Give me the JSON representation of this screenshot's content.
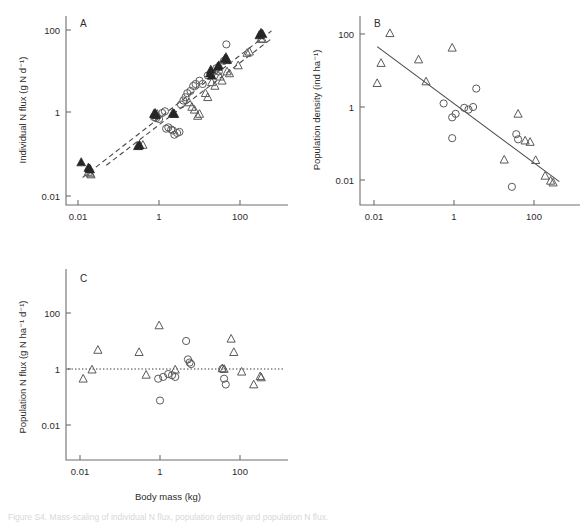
{
  "figure": {
    "caption": "Figure S4. Mass-scaling of individual N flux, population density and population N flux.",
    "panels": [
      "A",
      "B",
      "C"
    ]
  },
  "chart_data": [
    {
      "type": "scatter",
      "panel_label": "A",
      "title": "",
      "xlabel": "",
      "ylabel": "Individual N flux (g N d⁻¹)",
      "xscale": "log",
      "yscale": "log",
      "xlim": [
        0.0015,
        1000
      ],
      "ylim": [
        0.01,
        300
      ],
      "xticks": [
        0.01,
        1,
        100
      ],
      "xticklabels": [
        "0.01",
        "1",
        "100"
      ],
      "yticks": [
        0.01,
        1,
        100
      ],
      "yticklabels": [
        "0.01",
        "1",
        "100"
      ],
      "grid": false,
      "legend": null,
      "series": [
        {
          "name": "filled-triangle",
          "marker": "filled-triangle",
          "points": [
            [
              0.012,
              0.065
            ],
            [
              0.018,
              0.048
            ],
            [
              0.019,
              0.046
            ],
            [
              0.02,
              0.044
            ],
            [
              0.3,
              0.16
            ],
            [
              0.33,
              0.17
            ],
            [
              0.75,
              0.95
            ],
            [
              0.8,
              1.0
            ],
            [
              0.85,
              0.9
            ],
            [
              2.2,
              1.0
            ],
            [
              2.4,
              0.95
            ],
            [
              18,
              9.0
            ],
            [
              19,
              11.0
            ],
            [
              20,
              8.0
            ],
            [
              28,
              13.0
            ],
            [
              30,
              14.0
            ],
            [
              42,
              20.0
            ],
            [
              45,
              22.0
            ],
            [
              48,
              19.0
            ],
            [
              300,
              75.0
            ],
            [
              330,
              85.0
            ],
            [
              360,
              80.0
            ]
          ]
        },
        {
          "name": "open-triangle",
          "marker": "open-triangle",
          "points": [
            [
              0.018,
              0.038
            ],
            [
              0.02,
              0.035
            ],
            [
              0.021,
              0.033
            ],
            [
              0.32,
              0.16
            ],
            [
              0.4,
              0.17
            ],
            [
              0.8,
              0.9
            ],
            [
              0.9,
              0.95
            ],
            [
              2.3,
              0.95
            ],
            [
              5.5,
              1.8
            ],
            [
              6.5,
              1.4
            ],
            [
              7.5,
              1.2
            ],
            [
              9.0,
              0.85
            ],
            [
              10.0,
              0.95
            ],
            [
              14,
              3.0
            ],
            [
              16,
              2.4
            ],
            [
              20,
              5.5
            ],
            [
              24,
              4.5
            ],
            [
              32,
              7.5
            ],
            [
              36,
              6.0
            ],
            [
              48,
              10.0
            ],
            [
              55,
              9.0
            ],
            [
              90,
              14.0
            ],
            [
              150,
              28.0
            ],
            [
              170,
              30.0
            ],
            [
              330,
              62.0
            ],
            [
              360,
              60.0
            ]
          ]
        },
        {
          "name": "open-circle",
          "marker": "open-circle",
          "points": [
            [
              0.75,
              0.8
            ],
            [
              0.85,
              0.75
            ],
            [
              1.0,
              0.72
            ],
            [
              1.5,
              0.42
            ],
            [
              1.7,
              0.45
            ],
            [
              2.0,
              0.4
            ],
            [
              2.2,
              0.38
            ],
            [
              2.4,
              0.3
            ],
            [
              2.8,
              0.33
            ],
            [
              3.2,
              0.35
            ],
            [
              1.2,
              1.0
            ],
            [
              1.4,
              1.1
            ],
            [
              3.5,
              1.6
            ],
            [
              4.0,
              2.0
            ],
            [
              4.5,
              2.4
            ],
            [
              5.0,
              3.0
            ],
            [
              6.0,
              3.4
            ],
            [
              7.0,
              4.5
            ],
            [
              8.0,
              5.0
            ],
            [
              10,
              6.0
            ],
            [
              12,
              5.0
            ],
            [
              16,
              8.0
            ],
            [
              20,
              9.0
            ],
            [
              26,
              12.0
            ],
            [
              30,
              10.0
            ],
            [
              40,
              18.0
            ],
            [
              46,
              45.0
            ]
          ]
        }
      ],
      "fit_lines": [
        {
          "style": "dashed",
          "x": [
            0.013,
            600
          ],
          "y": [
            0.028,
            95
          ]
        },
        {
          "style": "dashed",
          "x": [
            0.05,
            600
          ],
          "y": [
            0.055,
            62
          ]
        }
      ]
    },
    {
      "type": "scatter",
      "panel_label": "B",
      "title": "",
      "xlabel": "",
      "ylabel": "Population density (ind ha⁻¹)",
      "xscale": "log",
      "yscale": "log",
      "xlim": [
        0.0015,
        1000
      ],
      "ylim": [
        0.002,
        300
      ],
      "xticks": [
        0.01,
        1,
        100
      ],
      "xticklabels": [
        "0.01",
        "1",
        "100"
      ],
      "yticks": [
        0.01,
        1,
        100
      ],
      "yticklabels": [
        "0.01",
        "1",
        "100"
      ],
      "grid": false,
      "legend": null,
      "series": [
        {
          "name": "open-triangle",
          "marker": "open-triangle",
          "points": [
            [
              0.012,
              4.5
            ],
            [
              0.015,
              16.0
            ],
            [
              0.025,
              105.0
            ],
            [
              0.13,
              20.0
            ],
            [
              0.2,
              5.0
            ],
            [
              0.9,
              42.0
            ],
            [
              40,
              0.65
            ],
            [
              60,
              0.12
            ],
            [
              80,
              0.11
            ],
            [
              110,
              0.035
            ],
            [
              190,
              0.013
            ],
            [
              260,
              0.0095
            ],
            [
              300,
              0.0085
            ],
            [
              18,
              0.036
            ]
          ]
        },
        {
          "name": "open-circle",
          "marker": "open-circle",
          "points": [
            [
              0.55,
              1.25
            ],
            [
              0.9,
              0.52
            ],
            [
              1.1,
              0.65
            ],
            [
              1.8,
              0.95
            ],
            [
              2.3,
              0.85
            ],
            [
              3.0,
              1.0
            ],
            [
              3.6,
              3.2
            ],
            [
              0.9,
              0.14
            ],
            [
              36,
              0.18
            ],
            [
              40,
              0.13
            ],
            [
              28,
              0.0065
            ]
          ]
        }
      ],
      "fit_lines": [
        {
          "style": "solid",
          "x": [
            0.012,
            430
          ],
          "y": [
            45.0,
            0.009
          ]
        }
      ]
    },
    {
      "type": "scatter",
      "panel_label": "C",
      "title": "",
      "xlabel": "Body mass (kg)",
      "ylabel": "Population N flux (g N ha⁻¹ d⁻¹)",
      "xscale": "log",
      "yscale": "log",
      "xlim": [
        0.0015,
        1000
      ],
      "ylim": [
        0.002,
        3000
      ],
      "xticks": [
        0.01,
        1,
        100
      ],
      "xticklabels": [
        "0.01",
        "1",
        "100"
      ],
      "yticks": [
        0.01,
        1,
        100
      ],
      "yticklabels": [
        "0.01",
        "1",
        "100"
      ],
      "grid": false,
      "legend": null,
      "reference_line": {
        "style": "dotted",
        "y": 1.0
      },
      "series": [
        {
          "name": "open-triangle",
          "marker": "open-triangle",
          "points": [
            [
              0.012,
              0.45
            ],
            [
              0.02,
              0.95
            ],
            [
              0.028,
              4.8
            ],
            [
              0.3,
              4.0
            ],
            [
              0.45,
              0.62
            ],
            [
              0.95,
              36.0
            ],
            [
              2.4,
              0.95
            ],
            [
              36,
              1.05
            ],
            [
              40,
              1.0
            ],
            [
              60,
              12.0
            ],
            [
              70,
              4.0
            ],
            [
              110,
              0.8
            ],
            [
              220,
              0.28
            ],
            [
              320,
              0.55
            ],
            [
              340,
              0.5
            ]
          ]
        },
        {
          "name": "open-circle",
          "marker": "open-circle",
          "points": [
            [
              0.9,
              0.45
            ],
            [
              1.2,
              0.52
            ],
            [
              1.6,
              0.66
            ],
            [
              2.0,
              0.6
            ],
            [
              2.4,
              0.52
            ],
            [
              4.5,
              10.0
            ],
            [
              5.0,
              2.2
            ],
            [
              5.5,
              1.7
            ],
            [
              6.0,
              1.5
            ],
            [
              1.0,
              0.075
            ],
            [
              36,
              1.0
            ],
            [
              40,
              0.45
            ],
            [
              44,
              0.28
            ]
          ]
        }
      ]
    }
  ]
}
